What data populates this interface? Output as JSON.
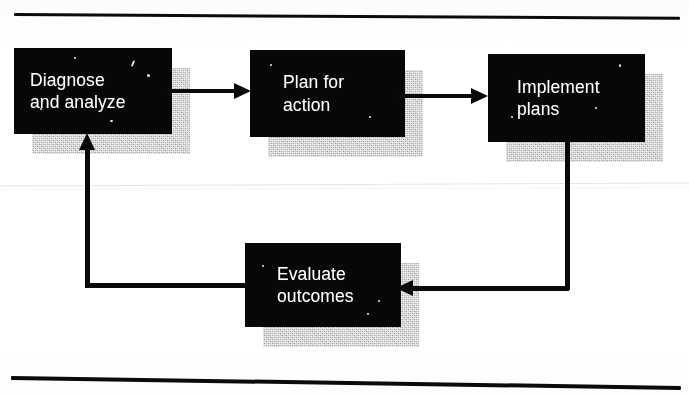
{
  "figure": {
    "type": "cycle-flowchart",
    "title": "",
    "background_color": "#fcfcfc",
    "box_fill_color": "#090909",
    "box_text_color": "#fdfdfd",
    "shadow_color": "#b9b9b9",
    "connector_color": "#0b0b0b",
    "rule_color": "#0d0d0d"
  },
  "rules": {
    "top_label": "top-divider-rule",
    "bottom_label": "bottom-divider-rule"
  },
  "nodes": [
    {
      "id": "diagnose",
      "label": "Diagnose\nand analyze",
      "line1": "Diagnose",
      "line2": "and analyze"
    },
    {
      "id": "plan",
      "label": "Plan for\naction",
      "line1": "Plan for",
      "line2": "action"
    },
    {
      "id": "implement",
      "label": "Implement\nplans",
      "line1": "Implement",
      "line2": "plans"
    },
    {
      "id": "evaluate",
      "label": "Evaluate\noutcomes",
      "line1": "Evaluate",
      "line2": "outcomes"
    }
  ],
  "connectors": [
    {
      "id": "arrow-diagnose-to-plan",
      "from": "diagnose",
      "to": "plan",
      "style": "straight-right"
    },
    {
      "id": "arrow-plan-to-implement",
      "from": "plan",
      "to": "implement",
      "style": "straight-right"
    },
    {
      "id": "arrow-implement-to-evaluate",
      "from": "implement",
      "to": "evaluate",
      "style": "elbow-down-left"
    },
    {
      "id": "arrow-evaluate-to-diagnose",
      "from": "evaluate",
      "to": "diagnose",
      "style": "elbow-left-up"
    }
  ]
}
